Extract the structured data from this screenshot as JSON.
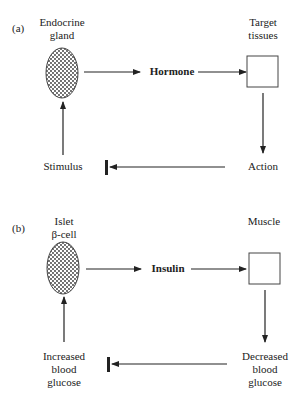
{
  "panels": [
    {
      "id": "a",
      "label": "(a)",
      "source_label_line1": "Endocrine",
      "source_label_line2": "gland",
      "signal": "Hormone",
      "target_label_line1": "Target",
      "target_label_line2": "tissues",
      "effect_line1": "Action",
      "effect_line2": "",
      "effect_line3": "",
      "trigger_line1": "Stimulus",
      "trigger_line2": "",
      "trigger_line3": ""
    },
    {
      "id": "b",
      "label": "(b)",
      "source_label_line1": "Islet",
      "source_label_line2": "β-cell",
      "signal": "Insulin",
      "target_label_line1": "Muscle",
      "target_label_line2": "",
      "effect_line1": "Decreased",
      "effect_line2": "blood",
      "effect_line3": "glucose",
      "trigger_line1": "Increased",
      "trigger_line2": "blood",
      "trigger_line3": "glucose"
    }
  ],
  "colors": {
    "line": "#222222",
    "fill_dots": "#333333",
    "background": "#ffffff"
  }
}
